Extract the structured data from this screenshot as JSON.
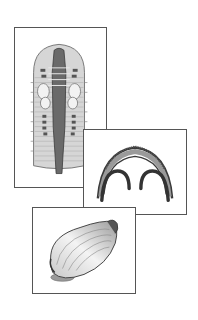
{
  "figure": {
    "panels": [
      {
        "id": "worm",
        "subject": "segmented-worm-dorsal-view-illustration"
      },
      {
        "id": "cross-section",
        "subject": "arched-cross-section-illustration"
      },
      {
        "id": "clam",
        "subject": "bivalve-shell-illustration"
      }
    ]
  },
  "colors": {
    "frame_border": "#555555",
    "background": "#ffffff",
    "ink_dark": "#3a3a3a",
    "ink_mid": "#8a8a8a",
    "fill_light": "#d6d6d6"
  }
}
